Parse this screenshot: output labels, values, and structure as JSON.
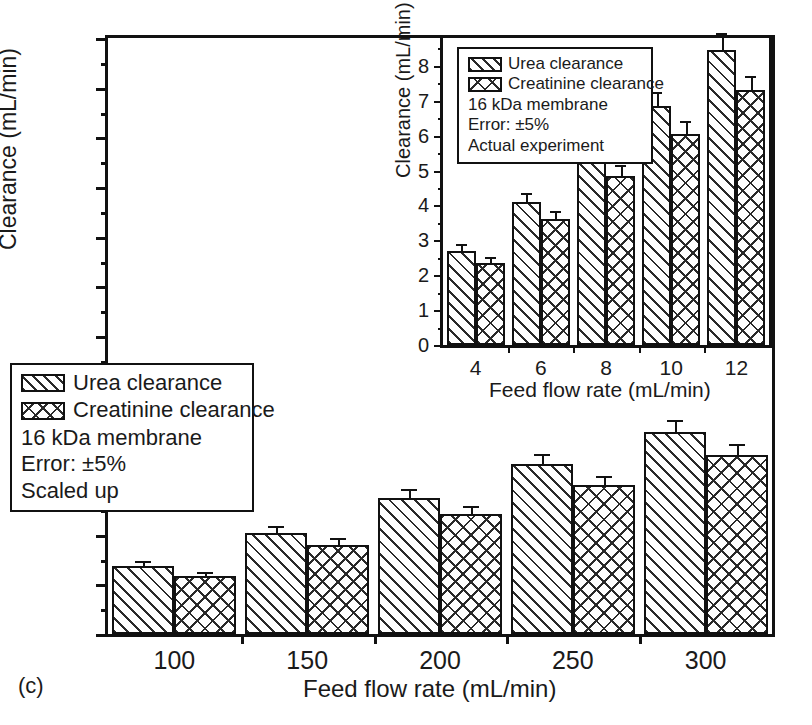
{
  "panel": {
    "label": "(c)"
  },
  "chart_data": [
    {
      "id": "main",
      "type": "bar",
      "title": "",
      "xlabel": "Feed flow rate (mL/min)",
      "ylabel": "Clearance (mL/min)",
      "categories": [
        "100",
        "150",
        "200",
        "250",
        "300"
      ],
      "series": [
        {
          "name": "Urea clearance",
          "values": [
            68,
            102,
            137,
            171,
            203
          ],
          "pattern": "diagonal-hatch"
        },
        {
          "name": "Creatinine clearance",
          "values": [
            58,
            90,
            121,
            150,
            180
          ],
          "pattern": "cross-hatch"
        }
      ],
      "error_percent": 5,
      "ylim": [
        0,
        600
      ],
      "ytick_step": 50,
      "yticks": [
        "0",
        "50",
        "100",
        "150",
        "200",
        "250",
        "300",
        "350",
        "400",
        "450",
        "500",
        "550",
        "600"
      ],
      "minor_ytick_step": 25,
      "grid": false,
      "legend_position": "lower-left",
      "annotations": [
        "16 kDa membrane",
        "Error: ±5%",
        "Scaled up"
      ]
    },
    {
      "id": "inset",
      "type": "bar",
      "title": "",
      "xlabel": "Feed flow rate (mL/min)",
      "ylabel": "Clearance (mL/min)",
      "categories": [
        "4",
        "6",
        "8",
        "10",
        "12"
      ],
      "series": [
        {
          "name": "Urea clearance",
          "values": [
            2.7,
            4.1,
            5.5,
            6.85,
            8.45
          ],
          "pattern": "diagonal-hatch"
        },
        {
          "name": "Creatinine clearance",
          "values": [
            2.35,
            3.6,
            4.85,
            6.05,
            7.3
          ],
          "pattern": "cross-hatch"
        }
      ],
      "error_percent": 5,
      "ylim": [
        0,
        8.8
      ],
      "ytick_step": 1,
      "yticks": [
        "0",
        "1",
        "2",
        "3",
        "4",
        "5",
        "6",
        "7",
        "8"
      ],
      "minor_ytick_step": 0.5,
      "grid": false,
      "legend_position": "upper-left",
      "annotations": [
        "16 kDa membrane",
        "Error: ±5%",
        "Actual experiment"
      ]
    }
  ],
  "main_chart": {
    "y_axis_title": "Clearance (mL/min)",
    "x_axis_title": "Feed flow rate (mL/min)",
    "legend": {
      "series": [
        {
          "label": "Urea clearance",
          "swatch": "diagonal-hatch-swatch"
        },
        {
          "label": "Creatinine clearance",
          "swatch": "cross-hatch-swatch"
        }
      ],
      "line_membrane": "16 kDa membrane",
      "line_error": "Error: ±5%",
      "line_mode": "Scaled up"
    }
  },
  "inset_chart": {
    "y_axis_title": "Clearance (mL/min)",
    "x_axis_title": "Feed flow rate (mL/min)",
    "legend": {
      "series": [
        {
          "label": "Urea clearance",
          "swatch": "diagonal-hatch-swatch"
        },
        {
          "label": "Creatinine clearance",
          "swatch": "cross-hatch-swatch"
        }
      ],
      "line_membrane": "16 kDa membrane",
      "line_error": "Error: ±5%",
      "line_mode": "Actual experiment"
    }
  },
  "colors": {
    "axis": "#111111",
    "hatch": "#2a2a2a",
    "background": "#ffffff"
  }
}
